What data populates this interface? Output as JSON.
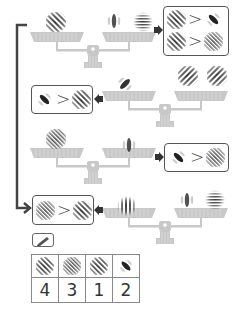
{
  "colors": {
    "scale": "#c8c8c8",
    "bracket": "#444444",
    "box_border": "#555555",
    "arrow": "#333333"
  },
  "symbols": {
    "greater_than": ">"
  },
  "rows": [
    {
      "scale": {
        "left_pan": [
          "diag-medium"
        ],
        "right_pan": [
          "vertical-blob",
          "horizontal-fine"
        ]
      },
      "result_box_side": "right",
      "comparisons": [
        {
          "left": "diag-medium",
          "op": ">",
          "right": "diag-blob-up"
        },
        {
          "left": "diag-medium",
          "op": ">",
          "right": "diag-fine"
        }
      ]
    },
    {
      "scale": {
        "left_pan": [
          "diag-blob-up"
        ],
        "right_pan": [
          "diag-medium-up",
          "diag-medium-up"
        ]
      },
      "result_box_side": "left",
      "comparisons": [
        {
          "left": "diag-blob",
          "op": ">",
          "right": "diag-medium"
        }
      ]
    },
    {
      "scale": {
        "left_pan": [
          "diag-fine"
        ],
        "right_pan": [
          "vertical-blob"
        ]
      },
      "result_box_side": "right",
      "comparisons": [
        {
          "left": "diag-blob",
          "op": ">",
          "right": "diag-fine"
        }
      ]
    },
    {
      "scale": {
        "left_pan": [
          "vertical-medium"
        ],
        "right_pan": [
          "vertical-blob",
          "horizontal-fine"
        ]
      },
      "result_box_side": "left",
      "comparisons": [
        {
          "left": "diag-fine",
          "op": ">",
          "right": "diag-medium"
        }
      ]
    }
  ],
  "answer": {
    "pencil_icon": "pencil-icon",
    "patches": [
      "diag-medium",
      "diag-fine",
      "diag-medium",
      "diag-blob"
    ],
    "ranks": [
      "4",
      "3",
      "1",
      "2"
    ]
  }
}
